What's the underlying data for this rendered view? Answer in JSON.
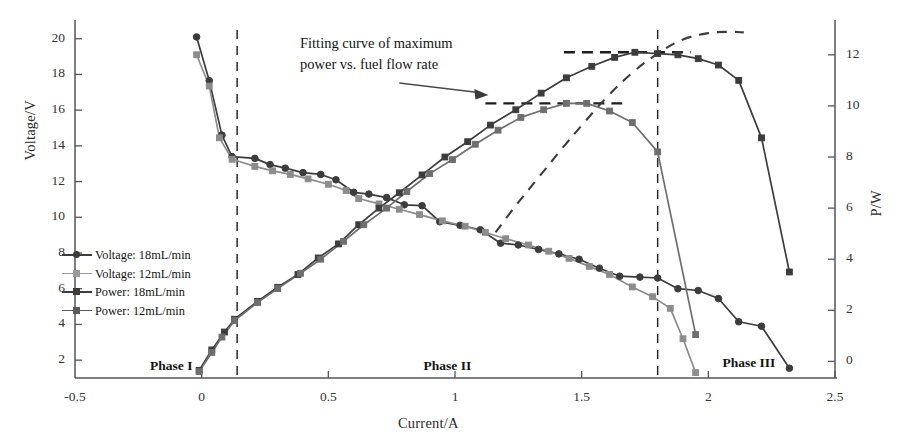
{
  "chart_data": {
    "type": "line",
    "title": "",
    "xlabel": "Current/A",
    "ylabel": "Voltage/V",
    "ylabel_secondary": "P/W",
    "xlim": [
      -0.5,
      2.5
    ],
    "ylim": [
      1.0,
      20.6
    ],
    "ylim_secondary": [
      -0.65,
      13.05
    ],
    "grid": false,
    "legend_position": "left-middle",
    "xticks": [
      "-0.5",
      "0",
      "0.5",
      "1",
      "1.5",
      "2",
      "2.5"
    ],
    "xtick_values": [
      -0.5,
      0,
      0.5,
      1,
      1.5,
      2,
      2.5
    ],
    "yticks_left": [
      "2",
      "4",
      "6",
      "8",
      "10",
      "12",
      "14",
      "16",
      "18",
      "20"
    ],
    "ytick_values_left": [
      2,
      4,
      6,
      8,
      10,
      12,
      14,
      16,
      18,
      20
    ],
    "yticks_right": [
      "0",
      "2",
      "4",
      "6",
      "8",
      "10",
      "12"
    ],
    "ytick_values_right": [
      0,
      2,
      4,
      6,
      8,
      10,
      12
    ],
    "series": [
      {
        "name": "Voltage: 18mL/min",
        "axis": "left",
        "marker": "circle",
        "color": "#3c3c3c",
        "x": [
          -0.02,
          0.03,
          0.08,
          0.12,
          0.21,
          0.27,
          0.33,
          0.4,
          0.47,
          0.53,
          0.6,
          0.66,
          0.73,
          0.8,
          0.87,
          0.94,
          1.02,
          1.1,
          1.18,
          1.25,
          1.33,
          1.41,
          1.49,
          1.57,
          1.65,
          1.73,
          1.8,
          1.88,
          1.96,
          2.04,
          2.12,
          2.21,
          2.32
        ],
        "y": [
          20.1,
          17.65,
          14.6,
          13.4,
          13.3,
          12.95,
          12.75,
          12.5,
          12.4,
          12.1,
          11.4,
          11.3,
          11.1,
          10.7,
          10.65,
          9.75,
          9.55,
          9.3,
          8.55,
          8.45,
          8.2,
          7.95,
          7.65,
          7.15,
          6.7,
          6.65,
          6.6,
          6.0,
          5.9,
          5.45,
          4.15,
          3.9,
          1.55
        ]
      },
      {
        "name": "Voltage: 12mL/min",
        "axis": "left",
        "marker": "square",
        "color": "#8c8c8c",
        "x": [
          -0.02,
          0.03,
          0.07,
          0.12,
          0.21,
          0.28,
          0.35,
          0.42,
          0.5,
          0.57,
          0.62,
          0.7,
          0.78,
          0.86,
          0.95,
          1.04,
          1.12,
          1.2,
          1.29,
          1.37,
          1.45,
          1.53,
          1.61,
          1.7,
          1.78,
          1.85,
          1.9,
          1.95
        ],
        "y": [
          19.1,
          17.35,
          14.45,
          13.25,
          12.85,
          12.6,
          12.4,
          12.15,
          11.85,
          11.5,
          11.05,
          10.75,
          10.45,
          10.15,
          9.8,
          9.5,
          9.15,
          8.8,
          8.45,
          8.1,
          7.7,
          7.25,
          6.8,
          6.1,
          5.55,
          4.9,
          3.2,
          1.3
        ]
      },
      {
        "name": "Power: 18mL/min",
        "axis": "right",
        "marker": "square",
        "color": "#3c3c3c",
        "x": [
          -0.01,
          0.04,
          0.09,
          0.13,
          0.22,
          0.3,
          0.38,
          0.46,
          0.54,
          0.62,
          0.7,
          0.78,
          0.87,
          0.96,
          1.05,
          1.14,
          1.24,
          1.34,
          1.44,
          1.54,
          1.63,
          1.71,
          1.8,
          1.88,
          1.96,
          2.04,
          2.12,
          2.21,
          2.32
        ],
        "y": [
          -0.35,
          0.45,
          1.15,
          1.65,
          2.35,
          2.9,
          3.4,
          4.05,
          4.6,
          5.35,
          6.0,
          6.6,
          7.3,
          8.0,
          8.6,
          9.25,
          9.85,
          10.5,
          11.1,
          11.55,
          11.9,
          12.1,
          12.05,
          12.0,
          11.85,
          11.6,
          11.0,
          8.75,
          3.5
        ]
      },
      {
        "name": "Power: 12mL/min",
        "axis": "right",
        "marker": "square",
        "color": "#6e6e6e",
        "x": [
          -0.01,
          0.04,
          0.08,
          0.13,
          0.22,
          0.3,
          0.39,
          0.47,
          0.56,
          0.64,
          0.73,
          0.81,
          0.9,
          0.99,
          1.08,
          1.17,
          1.26,
          1.35,
          1.44,
          1.52,
          1.61,
          1.7,
          1.8,
          1.95
        ],
        "y": [
          -0.4,
          0.35,
          0.95,
          1.6,
          2.3,
          2.85,
          3.45,
          4.0,
          4.7,
          5.35,
          6.0,
          6.65,
          7.35,
          7.9,
          8.5,
          9.05,
          9.55,
          9.85,
          10.1,
          10.1,
          9.8,
          9.35,
          8.2,
          1.05
        ]
      }
    ],
    "fit_curve": {
      "name": "Fitting curve of maximum power vs. fuel flow rate",
      "style": "dashed",
      "color": "#3c3c3c",
      "x": [
        1.16,
        1.24,
        1.33,
        1.42,
        1.51,
        1.6,
        1.7,
        1.8,
        1.9,
        2.0,
        2.08,
        2.14
      ],
      "y": [
        5.05,
        6.1,
        7.2,
        8.3,
        9.35,
        10.35,
        11.3,
        12.05,
        12.6,
        12.85,
        12.9,
        12.88
      ]
    },
    "peak_markers": [
      {
        "label": "max power 18mL/min",
        "y": 12.1,
        "x_start": 1.43,
        "x_end": 1.93,
        "style": "dashed"
      },
      {
        "label": "max power 12mL/min",
        "y": 10.1,
        "x_start": 1.12,
        "x_end": 1.66,
        "style": "dashed"
      }
    ],
    "phase_dividers": [
      {
        "x": 0.14,
        "style": "dashed"
      },
      {
        "x": 1.8,
        "style": "dashed"
      }
    ],
    "annotations": [
      {
        "text_line_1": "Fitting curve of maximum",
        "text_line_2": "power vs. fuel flow rate",
        "arrow_from_x": 0.78,
        "arrow_from_y": 10.9,
        "arrow_to_x": 1.12,
        "arrow_to_y": 10.45
      }
    ],
    "phase_regions": [
      {
        "label": "Phase I",
        "x_center": -0.12
      },
      {
        "label": "Phase II",
        "x_center": 0.97
      },
      {
        "label": "Phase III",
        "x_center": 2.16
      }
    ]
  },
  "axes": {
    "xlabel": "Current/A",
    "ylabel_left": "Voltage/V",
    "ylabel_right": "P/W"
  },
  "legend": {
    "items": [
      {
        "label": "Voltage: 18mL/min",
        "color": "#3c3c3c",
        "marker": "circle"
      },
      {
        "label": "Voltage: 12mL/min",
        "color": "#9a9a9a",
        "marker": "square"
      },
      {
        "label": "Power: 18mL/min",
        "color": "#3c3c3c",
        "marker": "square"
      },
      {
        "label": "Power: 12mL/min",
        "color": "#5a5a5a",
        "marker": "square"
      }
    ]
  },
  "annotation": {
    "line1": "Fitting curve of maximum",
    "line2": "power vs. fuel flow rate"
  },
  "phases": {
    "one": "Phase I",
    "two": "Phase II",
    "three": "Phase III"
  }
}
